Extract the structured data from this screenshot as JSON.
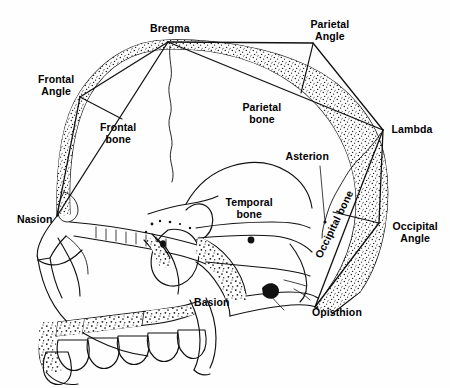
{
  "figure": {
    "background_color": "#fefefe",
    "ink_color": "#000000",
    "width": 450,
    "height": 388
  },
  "bone_labels": [
    {
      "id": "frontal-bone",
      "text_line1": "Frontal",
      "text_line2": "bone",
      "x": 118,
      "y": 133,
      "rotation": 0
    },
    {
      "id": "parietal-bone",
      "text_line1": "Parietal",
      "text_line2": "bone",
      "x": 262,
      "y": 113,
      "rotation": 0
    },
    {
      "id": "temporal-bone",
      "text_line1": "Temporal",
      "text_line2": "bone",
      "x": 249,
      "y": 208,
      "rotation": 0
    },
    {
      "id": "occipital-bone",
      "text_line1": "Occipital bone",
      "text_line2": "",
      "x": 334,
      "y": 224,
      "rotation": -64
    }
  ],
  "landmark_labels": [
    {
      "id": "bregma",
      "text_line1": "Bregma",
      "text_line2": "",
      "x": 170,
      "y": 28
    },
    {
      "id": "parietal-angle",
      "text_line1": "Parietal",
      "text_line2": "Angle",
      "x": 330,
      "y": 30
    },
    {
      "id": "frontal-angle",
      "text_line1": "Frontal",
      "text_line2": "Angle",
      "x": 56,
      "y": 85
    },
    {
      "id": "lambda",
      "text_line1": "Lambda",
      "text_line2": "",
      "x": 412,
      "y": 129
    },
    {
      "id": "asterion",
      "text_line1": "Asterion",
      "text_line2": "",
      "x": 307,
      "y": 156
    },
    {
      "id": "nasion",
      "text_line1": "Nasion",
      "text_line2": "",
      "x": 35,
      "y": 219
    },
    {
      "id": "occipital-angle",
      "text_line1": "Occipital",
      "text_line2": "Angle",
      "x": 415,
      "y": 232
    },
    {
      "id": "basion",
      "text_line1": "Basion",
      "text_line2": "",
      "x": 212,
      "y": 302
    },
    {
      "id": "opisthion",
      "text_line1": "Opisthion",
      "text_line2": "",
      "x": 337,
      "y": 312
    }
  ],
  "landmark_points": {
    "bregma": {
      "x": 168,
      "y": 42
    },
    "frontal_angle": {
      "x": 80,
      "y": 97
    },
    "parietal_angle": {
      "x": 313,
      "y": 43
    },
    "lambda": {
      "x": 383,
      "y": 130
    },
    "occipital_angle": {
      "x": 379,
      "y": 223
    },
    "opisthion": {
      "x": 315,
      "y": 307
    },
    "nasion": {
      "x": 57,
      "y": 216
    },
    "asterion": {
      "x": 325,
      "y": 222
    },
    "basion": {
      "x": 247,
      "y": 297
    }
  },
  "measurement_chords": [
    {
      "id": "nasion-bregma",
      "from": "nasion",
      "to": "bregma"
    },
    {
      "id": "nasion-frontal-angle",
      "from": "nasion",
      "to": "frontal_angle"
    },
    {
      "id": "frontal-angle-bregma",
      "from": "frontal_angle",
      "to": "bregma"
    },
    {
      "id": "bregma-parietal-angle",
      "from": "bregma",
      "to": "parietal_angle"
    },
    {
      "id": "bregma-lambda",
      "from": "bregma",
      "to": "lambda"
    },
    {
      "id": "parietal-angle-lambda",
      "from": "parietal_angle",
      "to": "lambda"
    },
    {
      "id": "lambda-occipital-angle",
      "from": "lambda",
      "to": "occipital_angle"
    },
    {
      "id": "lambda-opisthion",
      "from": "lambda",
      "to": "opisthion"
    },
    {
      "id": "occipital-angle-opisthion",
      "from": "occipital_angle",
      "to": "opisthion"
    }
  ],
  "perpendicular_drops": [
    {
      "id": "frontal-angle-drop",
      "x1": 80,
      "y1": 97,
      "x2": 122,
      "y2": 119
    },
    {
      "id": "parietal-angle-drop",
      "x1": 313,
      "y1": 44,
      "x2": 301,
      "y2": 93
    },
    {
      "id": "occipital-angle-drop",
      "x1": 379,
      "y1": 223,
      "x2": 333,
      "y2": 212
    }
  ],
  "leader_lines": [
    {
      "id": "asterion-leader",
      "x1": 320,
      "y1": 166,
      "x2": 325,
      "y2": 222
    }
  ]
}
